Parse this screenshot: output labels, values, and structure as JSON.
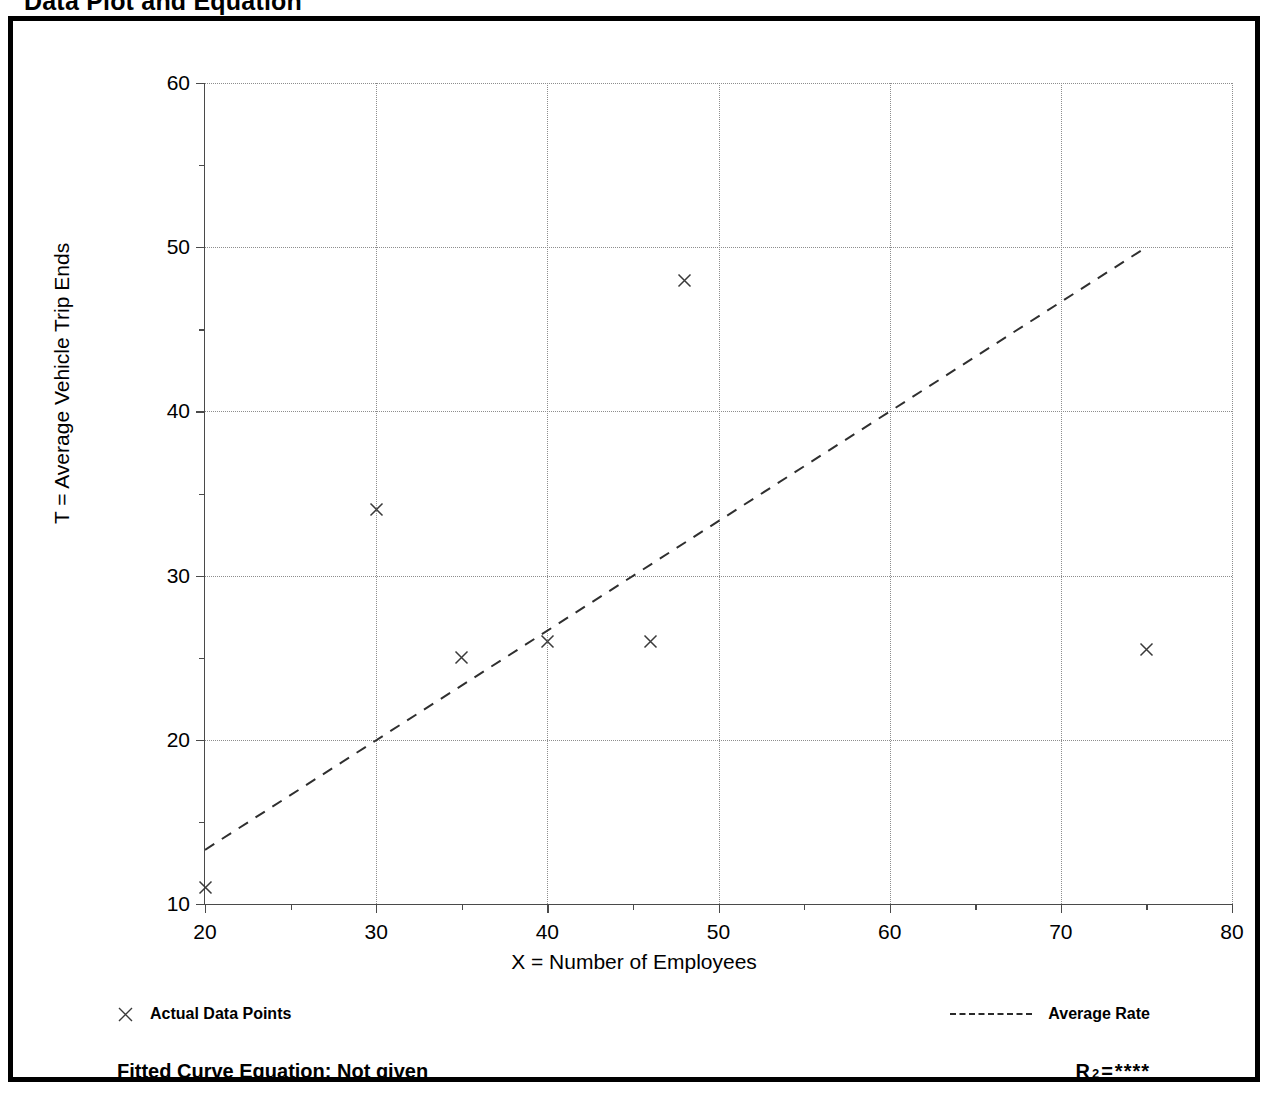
{
  "page": {
    "title": "Data Plot and Equation"
  },
  "chart_data": {
    "type": "scatter",
    "title": "Data Plot and Equation",
    "xlabel": "X = Number of Employees",
    "ylabel": "T = Average Vehicle Trip Ends",
    "xlim": [
      20,
      80
    ],
    "ylim": [
      10,
      60
    ],
    "xticks": [
      20,
      30,
      40,
      50,
      60,
      70,
      80
    ],
    "yticks": [
      10,
      20,
      30,
      40,
      50,
      60
    ],
    "xminor_ticks": [
      25,
      35,
      45,
      55,
      65,
      75
    ],
    "yminor_ticks": [
      15,
      25,
      35,
      45,
      55
    ],
    "grid": true,
    "legend_position": "below-axes",
    "series": [
      {
        "name": "Actual Data Points",
        "type": "scatter",
        "marker": "x",
        "points": [
          {
            "x": 20,
            "y": 11
          },
          {
            "x": 30,
            "y": 34
          },
          {
            "x": 35,
            "y": 25
          },
          {
            "x": 40,
            "y": 26
          },
          {
            "x": 46,
            "y": 26
          },
          {
            "x": 48,
            "y": 48
          },
          {
            "x": 75,
            "y": 25.5
          }
        ]
      },
      {
        "name": "Average Rate",
        "type": "line",
        "style": "dashed",
        "endpoints": [
          {
            "x": 20,
            "y": 13.3
          },
          {
            "x": 75,
            "y": 50
          }
        ]
      }
    ]
  },
  "axis": {
    "x_title": "X = Number of Employees",
    "y_title": "T = Average Vehicle Trip Ends",
    "x_tick_labels": [
      "20",
      "30",
      "40",
      "50",
      "60",
      "70",
      "80"
    ],
    "y_tick_labels": [
      "10",
      "20",
      "30",
      "40",
      "50",
      "60"
    ]
  },
  "legend": {
    "points_label": "Actual Data Points",
    "line_label": "Average Rate",
    "point_marker_icon": "x-marker-icon",
    "line_marker_icon": "dashed-line-icon"
  },
  "footer": {
    "equation_label": "Fitted Curve Equation:  Not given",
    "r2_symbol": "R",
    "r2_exponent": "2",
    "r2_equals": "=",
    "r2_value": "****"
  }
}
